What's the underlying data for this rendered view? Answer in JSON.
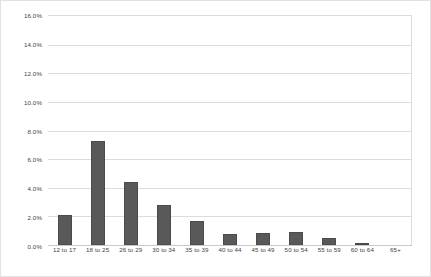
{
  "chart_data": {
    "type": "bar",
    "title": "",
    "subtitle": "",
    "xlabel": "",
    "ylabel": "",
    "categories": [
      "12 to 17",
      "18 to 25",
      "26 to 29",
      "30 to 34",
      "35 to 39",
      "40 to 44",
      "45 to 49",
      "50 to 54",
      "55 to 59",
      "60 to 64",
      "65+"
    ],
    "values": [
      2.1,
      7.3,
      4.4,
      2.8,
      1.7,
      0.8,
      0.85,
      0.9,
      0.5,
      0.1,
      0.0
    ],
    "series": [
      {
        "name": "",
        "values": [
          2.1,
          7.3,
          4.4,
          2.8,
          1.7,
          0.8,
          0.85,
          0.9,
          0.5,
          0.1,
          0.0
        ]
      }
    ],
    "ylim": [
      0.0,
      16.0
    ],
    "yticks": [
      0.0,
      2.0,
      4.0,
      6.0,
      8.0,
      10.0,
      12.0,
      14.0,
      16.0
    ],
    "ytick_labels": [
      "0.0%",
      "2.0%",
      "4.0%",
      "6.0%",
      "8.0%",
      "10.0%",
      "12.0%",
      "14.0%",
      "16.0%"
    ],
    "grid": true,
    "grid_axis": "y",
    "legend": false,
    "legend_position": "none",
    "bar_color": "#595959",
    "gridline_color": "#dcdcdc",
    "plot_background": "#ffffff",
    "axis_color": "#c8c8c8",
    "label_color": "#3f3f3f"
  }
}
